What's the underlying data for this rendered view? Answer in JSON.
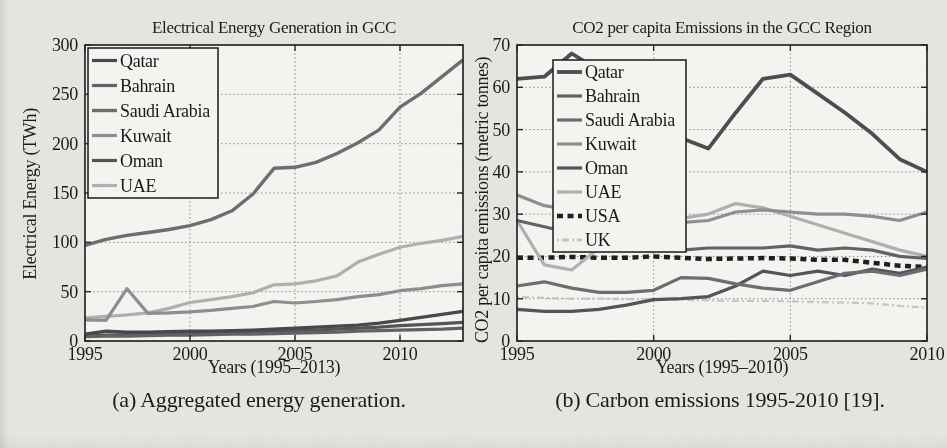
{
  "figure": {
    "caption_a": "(a) Aggregated energy generation.",
    "caption_b": "(b) Carbon emissions 1995-2010 [19]."
  },
  "colors": {
    "qatar": "#47474c",
    "bahrain": "#626267",
    "saudi_arabia": "#6d6d72",
    "kuwait": "#8f8f93",
    "oman": "#54545a",
    "uae": "#b1b1b3",
    "usa": "#1f1f23",
    "uk": "#c7c7c7",
    "axis": "#26262a",
    "grid": "#8d8d8d",
    "plot_background": "#f6f5f1",
    "page_background": "#e8e6e1"
  },
  "chart_data": [
    {
      "id": "energy-generation",
      "type": "line",
      "title": "Electrical Energy Generation in GCC",
      "xlabel": "Years (1995–2013)",
      "ylabel": "Electrical Energy (TWh)",
      "xlim": [
        1995,
        2013
      ],
      "ylim": [
        0,
        300
      ],
      "xticks": [
        1995,
        2000,
        2005,
        2010
      ],
      "yticks": [
        0,
        50,
        100,
        150,
        200,
        250,
        300
      ],
      "grid": true,
      "legend_position": "top-left",
      "x": [
        1995,
        1996,
        1997,
        1998,
        1999,
        2000,
        2001,
        2002,
        2003,
        2004,
        2005,
        2006,
        2007,
        2008,
        2009,
        2010,
        2011,
        2012,
        2013
      ],
      "series": [
        {
          "name": "Qatar",
          "color": "#47474c",
          "width": 3.2,
          "dash": null,
          "values": [
            7,
            10,
            9,
            9,
            9.5,
            10,
            10,
            10.5,
            11,
            12,
            13,
            14,
            15,
            16,
            18,
            21,
            24,
            27,
            30
          ]
        },
        {
          "name": "Bahrain",
          "color": "#626267",
          "width": 3.2,
          "dash": null,
          "values": [
            4.5,
            5,
            5,
            5.5,
            6,
            6,
            6.5,
            7,
            7,
            7.5,
            8,
            8.5,
            9,
            10,
            10.5,
            11,
            11.5,
            12,
            13
          ]
        },
        {
          "name": "Saudi Arabia",
          "color": "#6d6d72",
          "width": 3.4,
          "dash": null,
          "values": [
            97,
            103,
            107,
            110,
            113,
            117,
            123,
            132,
            149,
            175,
            176,
            181,
            190,
            201,
            214,
            237,
            251,
            268,
            285
          ]
        },
        {
          "name": "Kuwait",
          "color": "#8f8f93",
          "width": 3.2,
          "dash": null,
          "values": [
            21.5,
            21,
            53,
            28,
            28.5,
            29.5,
            31,
            33,
            35,
            40,
            38.5,
            40,
            42,
            45,
            47,
            51,
            53,
            56,
            58
          ]
        },
        {
          "name": "Oman",
          "color": "#54545a",
          "width": 3.2,
          "dash": null,
          "values": [
            6,
            6,
            6.5,
            7,
            7.5,
            8,
            8.5,
            9,
            9.5,
            10,
            10.5,
            11,
            12,
            13,
            14,
            15.5,
            16.5,
            17.5,
            19
          ]
        },
        {
          "name": "UAE",
          "color": "#b1b1b3",
          "width": 3.2,
          "dash": null,
          "values": [
            23.5,
            25,
            26.5,
            28.5,
            33,
            39,
            42,
            45,
            49,
            57,
            58,
            61,
            66,
            80,
            88,
            95,
            99,
            102,
            106
          ]
        }
      ]
    },
    {
      "id": "co2-emissions",
      "type": "line",
      "title": "CO2 per capita Emissions in the GCC Region",
      "xlabel": "Years (1995–2010)",
      "ylabel": "CO2 per capita emissions (metric tonnes)",
      "xlim": [
        1995,
        2010
      ],
      "ylim": [
        0,
        70
      ],
      "xticks": [
        1995,
        2000,
        2005,
        2010
      ],
      "yticks": [
        0,
        10,
        20,
        30,
        40,
        50,
        60,
        70
      ],
      "grid": true,
      "legend_position": "top-left",
      "x": [
        1995,
        1996,
        1997,
        1998,
        1999,
        2000,
        2001,
        2002,
        2003,
        2004,
        2005,
        2006,
        2007,
        2008,
        2009,
        2010
      ],
      "series": [
        {
          "name": "Qatar",
          "color": "#4d4d52",
          "width": 3.8,
          "dash": null,
          "values": [
            62,
            62.5,
            68,
            64,
            59,
            54,
            48,
            45.5,
            54,
            62,
            63,
            58.5,
            54,
            49,
            43,
            40
          ]
        },
        {
          "name": "Bahrain",
          "color": "#626267",
          "width": 3.2,
          "dash": null,
          "values": [
            28.5,
            27,
            25.5,
            24.5,
            23.5,
            22.5,
            21.5,
            22,
            22,
            22,
            22.5,
            21.5,
            22,
            21.5,
            20,
            19.5
          ]
        },
        {
          "name": "Saudi Arabia",
          "color": "#6d6d72",
          "width": 3.2,
          "dash": null,
          "values": [
            13,
            14,
            12.5,
            11.5,
            11.5,
            12,
            15,
            14.8,
            13.5,
            12.5,
            12,
            14,
            16,
            16.5,
            15.5,
            17
          ]
        },
        {
          "name": "Kuwait",
          "color": "#8f8f93",
          "width": 3.2,
          "dash": null,
          "values": [
            34.5,
            32,
            31,
            30,
            29,
            28.5,
            28,
            28.5,
            30.5,
            31,
            30.5,
            30,
            30,
            29.5,
            28.5,
            30.5
          ]
        },
        {
          "name": "Oman",
          "color": "#54545a",
          "width": 3.2,
          "dash": null,
          "values": [
            7.5,
            7,
            7,
            7.5,
            8.5,
            9.8,
            10,
            10.5,
            13,
            16.5,
            15.5,
            16.5,
            15.5,
            17,
            16,
            17.5
          ]
        },
        {
          "name": "UAE",
          "color": "#b1b1b3",
          "width": 3.2,
          "dash": null,
          "values": [
            28.5,
            18,
            16.8,
            22,
            26,
            28,
            29,
            30,
            32.5,
            31.5,
            29.5,
            27.5,
            25.5,
            23.5,
            21.5,
            20
          ]
        },
        {
          "name": "USA",
          "color": "#1f1f23",
          "width": 4.5,
          "dash": "6 4.5",
          "values": [
            19.7,
            19.7,
            19.9,
            19.7,
            19.7,
            20,
            19.7,
            19.4,
            19.5,
            19.6,
            19.5,
            19.2,
            19.2,
            18.5,
            17.8,
            17.5
          ]
        },
        {
          "name": "UK",
          "color": "#c7c7c7",
          "width": 2.3,
          "dash": "2 3 7 3",
          "values": [
            10.4,
            10.2,
            10,
            10,
            9.9,
            9.8,
            9.8,
            9.6,
            9.5,
            9.5,
            9.4,
            9.2,
            9.1,
            8.9,
            8.3,
            7.9
          ]
        }
      ]
    }
  ]
}
